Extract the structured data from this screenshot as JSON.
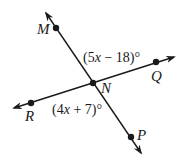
{
  "diagram": {
    "type": "intersecting-lines",
    "intersection_point": "N",
    "lines": [
      {
        "name": "line-MP",
        "through": [
          "M",
          "N",
          "P"
        ]
      },
      {
        "name": "line-RQ",
        "through": [
          "R",
          "N",
          "Q"
        ]
      }
    ],
    "points": {
      "M": {
        "label": "M"
      },
      "N": {
        "label": "N"
      },
      "P": {
        "label": "P"
      },
      "Q": {
        "label": "Q"
      },
      "R": {
        "label": "R"
      }
    },
    "angles": {
      "MNQ": {
        "open": "(5",
        "var": "x",
        "rest": " − 18)°"
      },
      "RNP": {
        "open": "(4",
        "var": "x",
        "rest": " + 7)°"
      }
    }
  },
  "colors": {
    "ink": "#1a1a1a",
    "background": "#ffffff"
  }
}
